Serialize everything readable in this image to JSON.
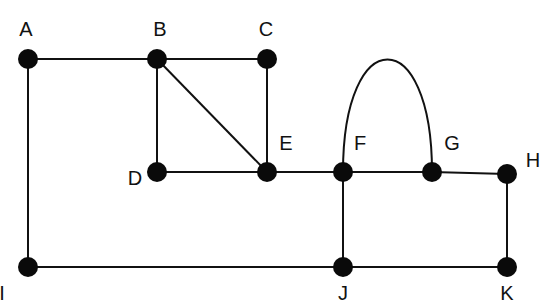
{
  "diagram": {
    "type": "undirected-graph",
    "colors": {
      "node": "#0a0a0a",
      "edge": "#111111",
      "background": "#ffffff"
    },
    "nodes": [
      {
        "id": "A",
        "label": "A",
        "x": 28,
        "y": 59,
        "lx": 26,
        "ly": 36
      },
      {
        "id": "B",
        "label": "B",
        "x": 157,
        "y": 59,
        "lx": 160,
        "ly": 36
      },
      {
        "id": "C",
        "label": "C",
        "x": 267,
        "y": 59,
        "lx": 266,
        "ly": 36
      },
      {
        "id": "D",
        "label": "D",
        "x": 157,
        "y": 172,
        "lx": 135,
        "ly": 185
      },
      {
        "id": "E",
        "label": "E",
        "x": 267,
        "y": 172,
        "lx": 286,
        "ly": 150
      },
      {
        "id": "F",
        "label": "F",
        "x": 343,
        "y": 172,
        "lx": 360,
        "ly": 150
      },
      {
        "id": "G",
        "label": "G",
        "x": 432,
        "y": 172,
        "lx": 452,
        "ly": 150
      },
      {
        "id": "H",
        "label": "H",
        "x": 507,
        "y": 174,
        "lx": 533,
        "ly": 167
      },
      {
        "id": "I",
        "label": "I",
        "x": 28,
        "y": 267,
        "lx": 2,
        "ly": 300
      },
      {
        "id": "J",
        "label": "J",
        "x": 343,
        "y": 267,
        "lx": 343,
        "ly": 300
      },
      {
        "id": "K",
        "label": "K",
        "x": 507,
        "y": 267,
        "lx": 507,
        "ly": 300
      }
    ],
    "edges": [
      {
        "from": "A",
        "to": "B"
      },
      {
        "from": "B",
        "to": "C"
      },
      {
        "from": "A",
        "to": "I"
      },
      {
        "from": "B",
        "to": "D"
      },
      {
        "from": "B",
        "to": "E"
      },
      {
        "from": "C",
        "to": "E"
      },
      {
        "from": "D",
        "to": "E"
      },
      {
        "from": "E",
        "to": "F"
      },
      {
        "from": "F",
        "to": "G"
      },
      {
        "from": "F",
        "to": "G",
        "curved": true
      },
      {
        "from": "G",
        "to": "H"
      },
      {
        "from": "F",
        "to": "J"
      },
      {
        "from": "H",
        "to": "K"
      },
      {
        "from": "I",
        "to": "J"
      },
      {
        "from": "J",
        "to": "K"
      }
    ]
  }
}
